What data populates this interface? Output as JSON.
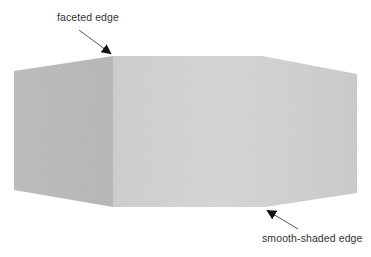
{
  "figure": {
    "labels": {
      "faceted": "faceted edge",
      "smooth": "smooth-shaded edge"
    },
    "shape": {
      "description": "extruded hexagonal prism with two visible faces",
      "left_face_color": "#b9b9b9",
      "right_face_color_left": "#cdcdcd",
      "right_face_color_center": "#d4d4d4",
      "right_face_color_right": "#c9c9c9"
    },
    "arrows": [
      {
        "name": "faceted-edge-arrow",
        "from": [
          76,
          30
        ],
        "to": [
          112,
          55
        ]
      },
      {
        "name": "smooth-edge-arrow",
        "from": [
          298,
          230
        ],
        "to": [
          266,
          210
        ]
      }
    ]
  }
}
